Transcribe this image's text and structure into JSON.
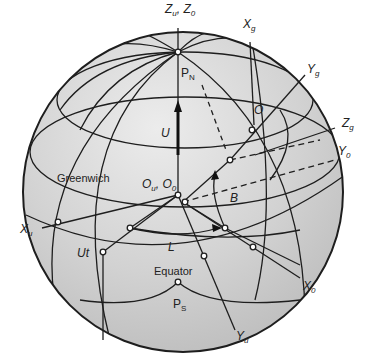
{
  "diagram": {
    "type": "celestial-sphere-coordinate-systems",
    "colors": {
      "sphere_fill": "#c8c8c8",
      "sphere_highlight": "#e6e6e6",
      "line": "#1e1e1e",
      "background": "#ffffff"
    },
    "axis_labels": {
      "zu_z0": {
        "main": "Z",
        "sub1": "u",
        "sep": ", Z",
        "sub2": "0"
      },
      "xg": {
        "main": "X",
        "sub": "g"
      },
      "yg": {
        "main": "Y",
        "sub": "g"
      },
      "zg": {
        "main": "Z",
        "sub": "g"
      },
      "y0": {
        "main": "Y",
        "sub": "0"
      },
      "xu": {
        "main": "X",
        "sub": "u"
      },
      "x0": {
        "main": "X",
        "sub": "0"
      },
      "yu": {
        "main": "Y",
        "sub": "u"
      }
    },
    "point_labels": {
      "pn": {
        "main": "P",
        "sub": "N"
      },
      "ps": {
        "main": "P",
        "sub": "S"
      },
      "o": "O",
      "ou_o0": {
        "main": "O",
        "sub1": "u",
        "sep": ", O",
        "sub2": "0"
      }
    },
    "quantity_labels": {
      "u": "U",
      "b": "B",
      "l": "L",
      "ut": "Ut"
    },
    "region_labels": {
      "greenwich": "Greenwich",
      "equator": "Equator"
    }
  }
}
